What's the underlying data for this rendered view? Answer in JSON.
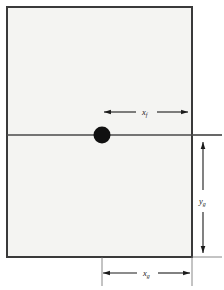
{
  "figure": {
    "type": "geometry-diagram",
    "background_color": "#ffffff",
    "plate": {
      "name": "rectangular-plate",
      "fill_color": "#f4f4f2",
      "border_color": "#3a3a3a",
      "x": 7,
      "y": 7,
      "width": 185,
      "height": 250
    },
    "point": {
      "name": "marked-point",
      "color": "#111111",
      "cx": 102,
      "cy": 135,
      "r": 8.5
    },
    "horizontal_axis_line": {
      "name": "horizontal-reference-line",
      "color": "#4a4a4a",
      "x1": 7,
      "x2": 222,
      "y": 135
    },
    "extension_lines": [
      {
        "name": "extension-line-right-top",
        "x1": 192,
        "y1": 135,
        "x2": 222,
        "y2": 135
      },
      {
        "name": "extension-line-right-bottom",
        "x1": 192,
        "y1": 257,
        "x2": 222,
        "y2": 257
      },
      {
        "name": "extension-line-bottom-left",
        "x1": 102,
        "y1": 257,
        "x2": 102,
        "y2": 286
      },
      {
        "name": "extension-line-bottom-right",
        "x1": 192,
        "y1": 257,
        "x2": 192,
        "y2": 286
      }
    ],
    "dimensions": [
      {
        "name": "dimension-xf",
        "label_base": "x",
        "label_sub": "f",
        "orientation": "horizontal",
        "from": 103,
        "to": 190,
        "at": 112,
        "label_x": 146,
        "label_y": 115
      },
      {
        "name": "dimension-yg",
        "label_base": "y",
        "label_sub": "g",
        "orientation": "vertical",
        "from": 140,
        "to": 254,
        "at": 203,
        "label_x": 203,
        "label_y": 200
      },
      {
        "name": "dimension-xg",
        "label_base": "x",
        "label_sub": "g",
        "orientation": "horizontal",
        "from": 102,
        "to": 192,
        "at": 273,
        "label_x": 147,
        "label_y": 276
      }
    ]
  }
}
